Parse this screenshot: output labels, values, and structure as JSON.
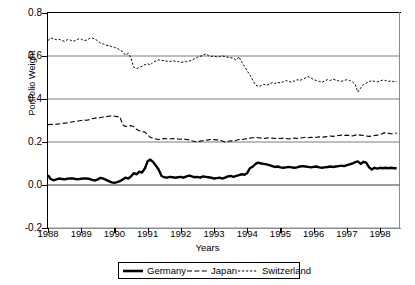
{
  "chart_data": {
    "type": "line",
    "title": "",
    "xlabel": "Years",
    "ylabel": "Portfolio Weight",
    "xlim": [
      1988,
      1998.6
    ],
    "ylim": [
      -0.2,
      0.8
    ],
    "yticks": [
      "0.8",
      "0.6",
      "0.4",
      "0.2",
      "0.0",
      "-0.2"
    ],
    "ytick_values": [
      0.8,
      0.6,
      0.4,
      0.2,
      0.0,
      -0.2
    ],
    "xticks": [
      "1988",
      "1989",
      "1990",
      "1991",
      "1992",
      "1993",
      "1994",
      "1995",
      "1996",
      "1997",
      "1998"
    ],
    "xtick_values": [
      1988,
      1989,
      1990,
      1991,
      1992,
      1993,
      1994,
      1995,
      1996,
      1997,
      1998
    ],
    "grid": "horizontal",
    "legend_position": "below-center",
    "series": [
      {
        "name": "Germany",
        "style": "solid",
        "linewidth": 2.4,
        "color": "#000000",
        "x": [
          1988.0,
          1988.08,
          1988.17,
          1988.25,
          1988.33,
          1988.42,
          1988.5,
          1988.58,
          1988.67,
          1988.75,
          1988.83,
          1988.92,
          1989.0,
          1989.08,
          1989.17,
          1989.25,
          1989.33,
          1989.42,
          1989.5,
          1989.58,
          1989.67,
          1989.75,
          1989.83,
          1989.92,
          1990.0,
          1990.08,
          1990.17,
          1990.25,
          1990.33,
          1990.42,
          1990.5,
          1990.58,
          1990.67,
          1990.75,
          1990.83,
          1990.92,
          1991.0,
          1991.08,
          1991.17,
          1991.25,
          1991.33,
          1991.42,
          1991.5,
          1991.58,
          1991.67,
          1991.75,
          1991.83,
          1991.92,
          1992.0,
          1992.08,
          1992.17,
          1992.25,
          1992.33,
          1992.42,
          1992.5,
          1992.58,
          1992.67,
          1992.75,
          1992.83,
          1992.92,
          1993.0,
          1993.08,
          1993.17,
          1993.25,
          1993.33,
          1993.42,
          1993.5,
          1993.58,
          1993.67,
          1993.75,
          1993.83,
          1993.92,
          1994.0,
          1994.08,
          1994.17,
          1994.25,
          1994.33,
          1994.42,
          1994.5,
          1994.58,
          1994.67,
          1994.75,
          1994.83,
          1994.92,
          1995.0,
          1995.08,
          1995.17,
          1995.25,
          1995.33,
          1995.42,
          1995.5,
          1995.58,
          1995.67,
          1995.75,
          1995.83,
          1995.92,
          1996.0,
          1996.08,
          1996.17,
          1996.25,
          1996.33,
          1996.42,
          1996.5,
          1996.58,
          1996.67,
          1996.75,
          1996.83,
          1996.92,
          1997.0,
          1997.08,
          1997.17,
          1997.25,
          1997.33,
          1997.42,
          1997.5,
          1997.58,
          1997.67,
          1997.75,
          1997.83,
          1997.92,
          1998.0,
          1998.08,
          1998.17,
          1998.25,
          1998.33,
          1998.42,
          1998.5
        ],
        "y": [
          0.045,
          0.028,
          0.022,
          0.026,
          0.03,
          0.028,
          0.026,
          0.029,
          0.031,
          0.03,
          0.028,
          0.027,
          0.029,
          0.031,
          0.03,
          0.028,
          0.024,
          0.021,
          0.026,
          0.033,
          0.03,
          0.024,
          0.018,
          0.012,
          0.01,
          0.013,
          0.018,
          0.026,
          0.034,
          0.03,
          0.04,
          0.055,
          0.05,
          0.062,
          0.058,
          0.078,
          0.11,
          0.118,
          0.106,
          0.09,
          0.072,
          0.042,
          0.036,
          0.034,
          0.038,
          0.036,
          0.034,
          0.036,
          0.038,
          0.034,
          0.04,
          0.044,
          0.04,
          0.036,
          0.038,
          0.034,
          0.04,
          0.038,
          0.036,
          0.034,
          0.03,
          0.032,
          0.034,
          0.03,
          0.034,
          0.04,
          0.042,
          0.038,
          0.042,
          0.046,
          0.05,
          0.048,
          0.056,
          0.078,
          0.086,
          0.098,
          0.104,
          0.1,
          0.098,
          0.096,
          0.092,
          0.088,
          0.084,
          0.086,
          0.082,
          0.08,
          0.082,
          0.084,
          0.082,
          0.08,
          0.082,
          0.086,
          0.088,
          0.086,
          0.084,
          0.082,
          0.084,
          0.086,
          0.082,
          0.08,
          0.082,
          0.084,
          0.086,
          0.084,
          0.086,
          0.088,
          0.09,
          0.088,
          0.092,
          0.096,
          0.1,
          0.106,
          0.11,
          0.098,
          0.108,
          0.104,
          0.082,
          0.072,
          0.08,
          0.076,
          0.08,
          0.078,
          0.08,
          0.078,
          0.08,
          0.078,
          0.078
        ]
      },
      {
        "name": "Japan",
        "style": "dashed",
        "linewidth": 1.1,
        "color": "#000000",
        "x": [
          1988.0,
          1988.08,
          1988.17,
          1988.25,
          1988.33,
          1988.42,
          1988.5,
          1988.58,
          1988.67,
          1988.75,
          1988.83,
          1988.92,
          1989.0,
          1989.08,
          1989.17,
          1989.25,
          1989.33,
          1989.42,
          1989.5,
          1989.58,
          1989.67,
          1989.75,
          1989.83,
          1989.92,
          1990.0,
          1990.08,
          1990.17,
          1990.25,
          1990.33,
          1990.42,
          1990.5,
          1990.58,
          1990.67,
          1990.75,
          1990.83,
          1990.92,
          1991.0,
          1991.08,
          1991.17,
          1991.25,
          1991.33,
          1991.42,
          1991.5,
          1991.58,
          1991.67,
          1991.75,
          1991.83,
          1991.92,
          1992.0,
          1992.08,
          1992.17,
          1992.25,
          1992.33,
          1992.42,
          1992.5,
          1992.58,
          1992.67,
          1992.75,
          1992.83,
          1992.92,
          1993.0,
          1993.08,
          1993.17,
          1993.25,
          1993.33,
          1993.42,
          1993.5,
          1993.58,
          1993.67,
          1993.75,
          1993.83,
          1993.92,
          1994.0,
          1994.08,
          1994.17,
          1994.25,
          1994.33,
          1994.42,
          1994.5,
          1994.58,
          1994.67,
          1994.75,
          1994.83,
          1994.92,
          1995.0,
          1995.08,
          1995.17,
          1995.25,
          1995.33,
          1995.42,
          1995.5,
          1995.58,
          1995.67,
          1995.75,
          1995.83,
          1995.92,
          1996.0,
          1996.08,
          1996.17,
          1996.25,
          1996.33,
          1996.42,
          1996.5,
          1996.58,
          1996.67,
          1996.75,
          1996.83,
          1996.92,
          1997.0,
          1997.08,
          1997.17,
          1997.25,
          1997.33,
          1997.42,
          1997.5,
          1997.58,
          1997.67,
          1997.75,
          1997.83,
          1997.92,
          1998.0,
          1998.08,
          1998.17,
          1998.25,
          1998.33,
          1998.42,
          1998.5
        ],
        "y": [
          0.28,
          0.282,
          0.281,
          0.283,
          0.284,
          0.286,
          0.288,
          0.289,
          0.292,
          0.294,
          0.296,
          0.298,
          0.3,
          0.302,
          0.301,
          0.304,
          0.308,
          0.312,
          0.31,
          0.314,
          0.316,
          0.318,
          0.32,
          0.322,
          0.32,
          0.318,
          0.316,
          0.28,
          0.272,
          0.274,
          0.276,
          0.272,
          0.258,
          0.252,
          0.248,
          0.246,
          0.234,
          0.222,
          0.216,
          0.214,
          0.212,
          0.214,
          0.216,
          0.215,
          0.214,
          0.216,
          0.215,
          0.214,
          0.213,
          0.214,
          0.212,
          0.21,
          0.206,
          0.202,
          0.2,
          0.204,
          0.206,
          0.208,
          0.21,
          0.212,
          0.211,
          0.21,
          0.209,
          0.205,
          0.2,
          0.202,
          0.206,
          0.204,
          0.208,
          0.212,
          0.21,
          0.214,
          0.216,
          0.218,
          0.22,
          0.222,
          0.22,
          0.218,
          0.216,
          0.218,
          0.22,
          0.218,
          0.216,
          0.218,
          0.216,
          0.218,
          0.216,
          0.214,
          0.216,
          0.218,
          0.216,
          0.218,
          0.22,
          0.222,
          0.22,
          0.222,
          0.22,
          0.222,
          0.224,
          0.222,
          0.224,
          0.226,
          0.228,
          0.226,
          0.228,
          0.23,
          0.232,
          0.23,
          0.232,
          0.23,
          0.228,
          0.232,
          0.234,
          0.232,
          0.23,
          0.228,
          0.226,
          0.228,
          0.23,
          0.232,
          0.234,
          0.24,
          0.244,
          0.24,
          0.238,
          0.24,
          0.242
        ]
      },
      {
        "name": "Switzerland",
        "style": "dotted",
        "linewidth": 1.0,
        "color": "#000000",
        "x": [
          1988.0,
          1988.08,
          1988.17,
          1988.25,
          1988.33,
          1988.42,
          1988.5,
          1988.58,
          1988.67,
          1988.75,
          1988.83,
          1988.92,
          1989.0,
          1989.08,
          1989.17,
          1989.25,
          1989.33,
          1989.42,
          1989.5,
          1989.58,
          1989.67,
          1989.75,
          1989.83,
          1989.92,
          1990.0,
          1990.08,
          1990.17,
          1990.25,
          1990.33,
          1990.42,
          1990.5,
          1990.58,
          1990.67,
          1990.75,
          1990.83,
          1990.92,
          1991.0,
          1991.08,
          1991.17,
          1991.25,
          1991.33,
          1991.42,
          1991.5,
          1991.58,
          1991.67,
          1991.75,
          1991.83,
          1991.92,
          1992.0,
          1992.08,
          1992.17,
          1992.25,
          1992.33,
          1992.42,
          1992.5,
          1992.58,
          1992.67,
          1992.75,
          1992.83,
          1992.92,
          1993.0,
          1993.08,
          1993.17,
          1993.25,
          1993.33,
          1993.42,
          1993.5,
          1993.58,
          1993.67,
          1993.75,
          1993.83,
          1993.92,
          1994.0,
          1994.08,
          1994.17,
          1994.25,
          1994.33,
          1994.42,
          1994.5,
          1994.58,
          1994.67,
          1994.75,
          1994.83,
          1994.92,
          1995.0,
          1995.08,
          1995.17,
          1995.25,
          1995.33,
          1995.42,
          1995.5,
          1995.58,
          1995.67,
          1995.75,
          1995.83,
          1995.92,
          1996.0,
          1996.08,
          1996.17,
          1996.25,
          1996.33,
          1996.42,
          1996.5,
          1996.58,
          1996.67,
          1996.75,
          1996.83,
          1996.92,
          1997.0,
          1997.08,
          1997.17,
          1997.25,
          1997.33,
          1997.42,
          1997.5,
          1997.58,
          1997.67,
          1997.75,
          1997.83,
          1997.92,
          1998.0,
          1998.08,
          1998.17,
          1998.25,
          1998.33,
          1998.42,
          1998.5
        ],
        "y": [
          0.672,
          0.684,
          0.68,
          0.676,
          0.678,
          0.672,
          0.668,
          0.676,
          0.674,
          0.668,
          0.672,
          0.68,
          0.678,
          0.672,
          0.674,
          0.682,
          0.684,
          0.678,
          0.67,
          0.66,
          0.656,
          0.65,
          0.648,
          0.644,
          0.64,
          0.636,
          0.628,
          0.62,
          0.604,
          0.612,
          0.59,
          0.548,
          0.542,
          0.546,
          0.552,
          0.56,
          0.564,
          0.558,
          0.572,
          0.578,
          0.582,
          0.58,
          0.578,
          0.576,
          0.574,
          0.578,
          0.576,
          0.574,
          0.57,
          0.572,
          0.574,
          0.576,
          0.58,
          0.588,
          0.594,
          0.598,
          0.604,
          0.61,
          0.602,
          0.598,
          0.6,
          0.596,
          0.598,
          0.6,
          0.598,
          0.594,
          0.592,
          0.59,
          0.58,
          0.596,
          0.572,
          0.552,
          0.53,
          0.512,
          0.486,
          0.466,
          0.458,
          0.462,
          0.468,
          0.464,
          0.47,
          0.476,
          0.472,
          0.478,
          0.474,
          0.48,
          0.486,
          0.482,
          0.478,
          0.484,
          0.49,
          0.486,
          0.492,
          0.498,
          0.504,
          0.498,
          0.49,
          0.486,
          0.482,
          0.478,
          0.484,
          0.49,
          0.486,
          0.492,
          0.488,
          0.484,
          0.482,
          0.486,
          0.49,
          0.486,
          0.48,
          0.468,
          0.432,
          0.452,
          0.468,
          0.474,
          0.48,
          0.486,
          0.482,
          0.48,
          0.484,
          0.488,
          0.486,
          0.482,
          0.484,
          0.48,
          0.482
        ]
      }
    ]
  },
  "legend": {
    "items": [
      {
        "label": "Germany",
        "style": "solid"
      },
      {
        "label": "Japan",
        "style": "dashed"
      },
      {
        "label": "Switzerland",
        "style": "dotted"
      }
    ]
  }
}
